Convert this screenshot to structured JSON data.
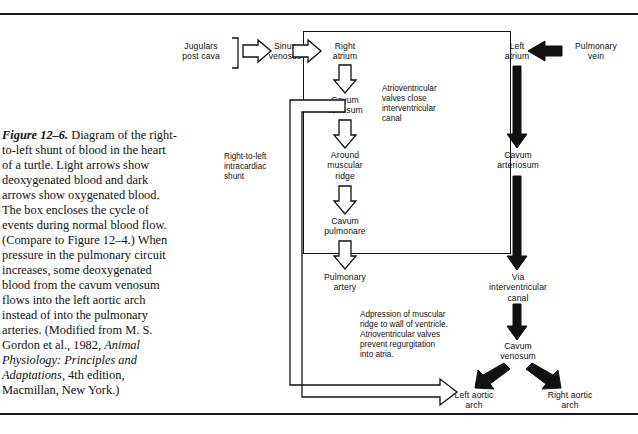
{
  "figure": {
    "number": "Figure 12–6.",
    "caption_rest": "  Diagram of the right-to-left shunt of blood in the heart of a turtle. Light arrows show deoxygenated blood and dark arrows show oxygenated blood. The box encloses the cycle of events during normal blood flow. (Compare to Figure 12–4.) When pressure in the pulmonary circuit increases, some deoxygenated blood from the cavum venosum flows into the left aortic arch instead of into the pulmonary arteries. (Modified from M. S. Gordon et al., 1982, ",
    "caption_italic": "Animal Physiology: Principles and Adaptations",
    "caption_tail": ", 4th edition, Macmillan, New York.)"
  },
  "diagram": {
    "nodes": {
      "jugulars": "Jugulars\npost cava",
      "sinus_venosus": "Sinus\nvenosus",
      "right_atrium": "Right\natrium",
      "cavum_venosum_top": "Cavum\nvenosum",
      "around_muscular_ridge": "Around\nmuscular\nridge",
      "cavum_pulmonare": "Cavum\npulmonare",
      "pulmonary_artery": "Pulmonary\nartery",
      "left_atrium": "Left\natrium",
      "pulmonary_vein": "Pulmonary\nvein",
      "cavum_arteriosum": "Cavum\narteriosum",
      "via_interventricular_canal": "Via\ninterventricular\ncanal",
      "cavum_venosum_bottom": "Cavum\nvenosum",
      "left_aortic_arch": "Left aortic\narch",
      "right_aortic_arch": "Right aortic\narch"
    },
    "annotations": {
      "shunt_label": "Right-to-left\nintracardiac\nshunt",
      "av_valves_close": "Atrioventricular\nvalves close\ninterventricular\ncanal",
      "adpression": "Adpression of muscular\nridge to wall of ventricle.\nAtrioventricular valves\nprevent regurgitation\ninto atria."
    },
    "colors": {
      "ink": "#111111",
      "paper": "#ffffff"
    }
  }
}
